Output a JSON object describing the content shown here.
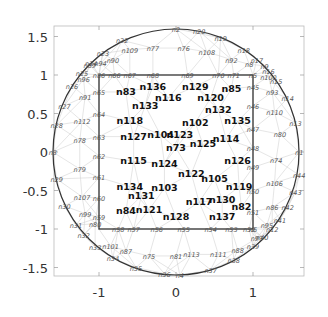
{
  "chart_data": {
    "type": "scatter",
    "title": "",
    "xlabel": "",
    "ylabel": "",
    "xlim": [
      -1.6,
      1.6
    ],
    "ylim": [
      -1.6,
      1.6
    ],
    "x_ticks": [
      "-1",
      "0",
      "1"
    ],
    "y_ticks": [
      "1.5",
      "1",
      "0.5",
      "0",
      "-0.5",
      "-1",
      "-1.5"
    ],
    "grid": false,
    "shapes": [
      {
        "type": "circle",
        "center": [
          0,
          0
        ],
        "radius": 1.6
      },
      {
        "type": "square",
        "xmin": -1,
        "xmax": 1,
        "ymin": -1,
        "ymax": 1
      }
    ],
    "boundary_nodes_circle": [
      {
        "label": "n1",
        "x": 1.6,
        "y": 0.0
      },
      {
        "label": "n13",
        "x": 1.55,
        "y": 0.38
      },
      {
        "label": "n14",
        "x": 1.45,
        "y": 0.7
      },
      {
        "label": "n15",
        "x": 1.3,
        "y": 0.92
      },
      {
        "label": "n16",
        "x": 1.2,
        "y": 1.05
      },
      {
        "label": "n17",
        "x": 1.05,
        "y": 1.2
      },
      {
        "label": "n18",
        "x": 0.88,
        "y": 1.33
      },
      {
        "label": "n19",
        "x": 0.58,
        "y": 1.48
      },
      {
        "label": "n20",
        "x": 0.3,
        "y": 1.57
      },
      {
        "label": "n2",
        "x": 0.0,
        "y": 1.6
      },
      {
        "label": "n22",
        "x": -0.7,
        "y": 1.45
      },
      {
        "label": "n23",
        "x": -0.95,
        "y": 1.28
      },
      {
        "label": "n24",
        "x": -1.1,
        "y": 1.15
      },
      {
        "label": "n25",
        "x": -1.22,
        "y": 1.02
      },
      {
        "label": "n26",
        "x": -1.35,
        "y": 0.86
      },
      {
        "label": "n27",
        "x": -1.45,
        "y": 0.6
      },
      {
        "label": "n28",
        "x": -1.55,
        "y": 0.35
      },
      {
        "label": "n3",
        "x": -1.6,
        "y": 0.0
      },
      {
        "label": "n29",
        "x": -1.55,
        "y": -0.35
      },
      {
        "label": "n30",
        "x": -1.45,
        "y": -0.7
      },
      {
        "label": "n31",
        "x": -1.3,
        "y": -0.95
      },
      {
        "label": "n32",
        "x": -1.2,
        "y": -1.08
      },
      {
        "label": "n33",
        "x": -1.05,
        "y": -1.23
      },
      {
        "label": "n34",
        "x": -0.82,
        "y": -1.38
      },
      {
        "label": "n35",
        "x": -0.52,
        "y": -1.5
      },
      {
        "label": "n36",
        "x": -0.15,
        "y": -1.58
      },
      {
        "label": "n4",
        "x": 0.05,
        "y": -1.6
      },
      {
        "label": "n37",
        "x": 0.45,
        "y": -1.53
      },
      {
        "label": "n38",
        "x": 0.75,
        "y": -1.4
      },
      {
        "label": "n39",
        "x": 1.0,
        "y": -1.22
      },
      {
        "label": "n40",
        "x": 1.12,
        "y": -1.1
      },
      {
        "label": "n12",
        "x": 1.25,
        "y": -1.0
      },
      {
        "label": "n41",
        "x": 1.35,
        "y": -0.88
      },
      {
        "label": "n42",
        "x": 1.45,
        "y": -0.72
      },
      {
        "label": "n43",
        "x": 1.55,
        "y": -0.52
      },
      {
        "label": "n44",
        "x": 1.6,
        "y": -0.3
      }
    ],
    "square_edge_nodes": [
      {
        "label": "n5",
        "x": 1.0,
        "y": 1.0
      },
      {
        "label": "n71",
        "x": 0.75,
        "y": 1.0
      },
      {
        "label": "n70",
        "x": 0.55,
        "y": 1.0
      },
      {
        "label": "n69",
        "x": 0.15,
        "y": 1.0
      },
      {
        "label": "n68",
        "x": -0.3,
        "y": 1.0
      },
      {
        "label": "n67",
        "x": -0.6,
        "y": 1.0
      },
      {
        "label": "n66",
        "x": -0.8,
        "y": 1.0
      },
      {
        "label": "n86",
        "x": -1.0,
        "y": 1.0
      },
      {
        "label": "n65",
        "x": -1.0,
        "y": 0.78
      },
      {
        "label": "n64",
        "x": -1.0,
        "y": 0.5
      },
      {
        "label": "n63",
        "x": -1.0,
        "y": 0.2
      },
      {
        "label": "n62",
        "x": -1.0,
        "y": -0.05
      },
      {
        "label": "n61",
        "x": -1.0,
        "y": -0.33
      },
      {
        "label": "n60",
        "x": -1.0,
        "y": -0.6
      },
      {
        "label": "n59",
        "x": -1.0,
        "y": -0.85
      },
      {
        "label": "n58",
        "x": -0.75,
        "y": -1.0
      },
      {
        "label": "n57",
        "x": -0.55,
        "y": -1.0
      },
      {
        "label": "n56",
        "x": -0.25,
        "y": -1.0
      },
      {
        "label": "n55",
        "x": 0.1,
        "y": -1.0
      },
      {
        "label": "n54",
        "x": 0.45,
        "y": -1.0
      },
      {
        "label": "n53",
        "x": 0.72,
        "y": -1.0
      },
      {
        "label": "n52",
        "x": 0.95,
        "y": -1.0
      },
      {
        "label": "n6",
        "x": 1.0,
        "y": -1.0
      },
      {
        "label": "n51",
        "x": 1.0,
        "y": -0.78
      },
      {
        "label": "n50",
        "x": 1.0,
        "y": -0.5
      },
      {
        "label": "n49",
        "x": 1.0,
        "y": -0.2
      },
      {
        "label": "n48",
        "x": 1.0,
        "y": 0.05
      },
      {
        "label": "n47",
        "x": 1.0,
        "y": 0.3
      },
      {
        "label": "n46",
        "x": 1.0,
        "y": 0.6
      },
      {
        "label": "n45",
        "x": 1.0,
        "y": 0.85
      }
    ],
    "ring_nodes": [
      {
        "label": "n77",
        "x": -0.3,
        "y": 1.35
      },
      {
        "label": "n76",
        "x": 0.1,
        "y": 1.35
      },
      {
        "label": "n108",
        "x": 0.4,
        "y": 1.3
      },
      {
        "label": "n92",
        "x": 0.72,
        "y": 1.2
      },
      {
        "label": "n8",
        "x": 0.95,
        "y": 1.14
      },
      {
        "label": "n9",
        "x": 1.15,
        "y": 1.12
      },
      {
        "label": "n100",
        "x": 1.2,
        "y": 0.98
      },
      {
        "label": "n109",
        "x": -0.6,
        "y": 1.33
      },
      {
        "label": "n90",
        "x": -0.82,
        "y": 1.2
      },
      {
        "label": "n94",
        "x": -0.98,
        "y": 1.15
      },
      {
        "label": "n89",
        "x": -1.12,
        "y": 1.13
      },
      {
        "label": "n96",
        "x": -1.2,
        "y": 0.95
      },
      {
        "label": "n91",
        "x": -1.18,
        "y": 0.72
      },
      {
        "label": "n112",
        "x": -1.22,
        "y": 0.4
      },
      {
        "label": "n78",
        "x": -1.25,
        "y": 0.15
      },
      {
        "label": "n79",
        "x": -1.25,
        "y": -0.22
      },
      {
        "label": "n107",
        "x": -1.22,
        "y": -0.58
      },
      {
        "label": "n99",
        "x": -1.18,
        "y": -0.8
      },
      {
        "label": "n80b",
        "x": -1.05,
        "y": -0.93
      },
      {
        "label": "n113",
        "x": 0.2,
        "y": -1.33
      },
      {
        "label": "n111",
        "x": 0.55,
        "y": -1.33
      },
      {
        "label": "n81",
        "x": 0.0,
        "y": -1.35
      },
      {
        "label": "n75",
        "x": -0.35,
        "y": -1.35
      },
      {
        "label": "n87",
        "x": -0.65,
        "y": -1.28
      },
      {
        "label": "n101",
        "x": -0.85,
        "y": -1.22
      },
      {
        "label": "n88",
        "x": 0.8,
        "y": -1.27
      },
      {
        "label": "n97",
        "x": 1.05,
        "y": -1.12
      },
      {
        "label": "n95",
        "x": 1.18,
        "y": -0.95
      },
      {
        "label": "n86b",
        "x": 1.25,
        "y": -0.72
      },
      {
        "label": "n106",
        "x": 1.28,
        "y": -0.4
      },
      {
        "label": "n74",
        "x": 1.3,
        "y": -0.1
      },
      {
        "label": "n80",
        "x": 1.35,
        "y": 0.23
      },
      {
        "label": "n110",
        "x": 1.28,
        "y": 0.52
      },
      {
        "label": "n93",
        "x": 1.25,
        "y": 0.78
      }
    ],
    "interior_nodes": [
      {
        "label": "n136",
        "x": -0.3,
        "y": 0.85
      },
      {
        "label": "n83",
        "x": -0.65,
        "y": 0.78
      },
      {
        "label": "n116",
        "x": -0.1,
        "y": 0.7
      },
      {
        "label": "n129",
        "x": 0.25,
        "y": 0.85
      },
      {
        "label": "n85",
        "x": 0.72,
        "y": 0.82
      },
      {
        "label": "n120",
        "x": 0.45,
        "y": 0.7
      },
      {
        "label": "n133",
        "x": -0.4,
        "y": 0.6
      },
      {
        "label": "n132",
        "x": 0.55,
        "y": 0.55
      },
      {
        "label": "n118",
        "x": -0.6,
        "y": 0.4
      },
      {
        "label": "n102",
        "x": 0.25,
        "y": 0.38
      },
      {
        "label": "n135",
        "x": 0.8,
        "y": 0.4
      },
      {
        "label": "n127",
        "x": -0.55,
        "y": 0.2
      },
      {
        "label": "n104",
        "x": -0.2,
        "y": 0.22
      },
      {
        "label": "n123",
        "x": 0.05,
        "y": 0.22
      },
      {
        "label": "n114",
        "x": 0.65,
        "y": 0.17
      },
      {
        "label": "n73",
        "x": 0.0,
        "y": 0.05
      },
      {
        "label": "n125",
        "x": 0.35,
        "y": 0.1
      },
      {
        "label": "n115",
        "x": -0.55,
        "y": -0.12
      },
      {
        "label": "n124",
        "x": -0.15,
        "y": -0.15
      },
      {
        "label": "n126",
        "x": 0.8,
        "y": -0.12
      },
      {
        "label": "n122",
        "x": 0.2,
        "y": -0.28
      },
      {
        "label": "n105",
        "x": 0.5,
        "y": -0.35
      },
      {
        "label": "n119",
        "x": 0.82,
        "y": -0.45
      },
      {
        "label": "n134",
        "x": -0.6,
        "y": -0.45
      },
      {
        "label": "n103",
        "x": -0.15,
        "y": -0.47
      },
      {
        "label": "n131",
        "x": -0.45,
        "y": -0.57
      },
      {
        "label": "n117",
        "x": 0.3,
        "y": -0.65
      },
      {
        "label": "n130",
        "x": 0.6,
        "y": -0.62
      },
      {
        "label": "n82",
        "x": 0.85,
        "y": -0.72
      },
      {
        "label": "n84",
        "x": -0.65,
        "y": -0.77
      },
      {
        "label": "n121",
        "x": -0.35,
        "y": -0.75
      },
      {
        "label": "n128",
        "x": 0.0,
        "y": -0.85
      },
      {
        "label": "n137",
        "x": 0.6,
        "y": -0.85
      }
    ]
  }
}
